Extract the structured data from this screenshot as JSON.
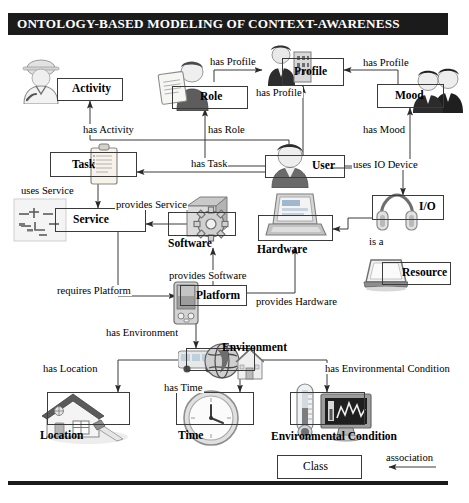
{
  "title": "ONTOLOGY-BASED MODELING OF CONTEXT-AWARENESS",
  "nodes": [
    {
      "id": "activity",
      "label": "Activity",
      "icon": "worker-person-icon"
    },
    {
      "id": "role",
      "label": "Role",
      "icon": "person-clipboard-icon"
    },
    {
      "id": "profile",
      "label": "Profile",
      "icon": "person-document-icon"
    },
    {
      "id": "mood",
      "label": "Mood",
      "icon": "two-people-icon"
    },
    {
      "id": "task",
      "label": "Task",
      "icon": "clipboard-icon"
    },
    {
      "id": "user",
      "label": "User",
      "icon": "person-icon"
    },
    {
      "id": "io",
      "label": "I/O",
      "icon": "headphones-icon"
    },
    {
      "id": "service",
      "label": "Service",
      "icon": "blueprint-icon"
    },
    {
      "id": "software",
      "label": "Software",
      "icon": "gear-box-icon"
    },
    {
      "id": "hardware",
      "label": "Hardware",
      "icon": "laptop-icon"
    },
    {
      "id": "resource",
      "label": "Resource",
      "icon": "tablet-icon"
    },
    {
      "id": "platform",
      "label": "Platform",
      "icon": "pda-icon"
    },
    {
      "id": "environment",
      "label": "Environment",
      "icon": "globe-bus-house-icon"
    },
    {
      "id": "location",
      "label": "Location",
      "icon": "house-icon"
    },
    {
      "id": "time",
      "label": "Time",
      "icon": "clock-icon"
    },
    {
      "id": "envcondition",
      "label": "Environmental Condition",
      "icon": "thermometer-monitor-icon"
    }
  ],
  "edges": [
    {
      "id": "has-activity",
      "label": "has Activity",
      "from": "user",
      "to": "activity"
    },
    {
      "id": "has-role",
      "label": "has Role",
      "from": "user",
      "to": "role"
    },
    {
      "id": "has-profile-role",
      "label": "has Profile",
      "from": "role",
      "to": "profile"
    },
    {
      "id": "has-profile-user",
      "label": "has Profile",
      "from": "user",
      "to": "profile"
    },
    {
      "id": "has-profile-mood",
      "label": "has Profile",
      "from": "mood",
      "to": "profile"
    },
    {
      "id": "has-mood",
      "label": "has Mood",
      "from": "user",
      "to": "mood"
    },
    {
      "id": "has-task",
      "label": "has Task",
      "from": "user",
      "to": "task"
    },
    {
      "id": "uses-service",
      "label": "uses Service",
      "from": "task",
      "to": "service"
    },
    {
      "id": "provides-service",
      "label": "provides Service",
      "from": "software",
      "to": "service"
    },
    {
      "id": "uses-io-device",
      "label": "uses IO Device",
      "from": "user",
      "to": "io"
    },
    {
      "id": "is-a",
      "label": "is a",
      "from": "io",
      "to": "hardware"
    },
    {
      "id": "provides-hardware",
      "label": "provides Hardware",
      "from": "platform",
      "to": "hardware"
    },
    {
      "id": "provides-software",
      "label": "provides Software",
      "from": "platform",
      "to": "software"
    },
    {
      "id": "requires-platform",
      "label": "requires Platform",
      "from": "service",
      "to": "platform"
    },
    {
      "id": "has-environment",
      "label": "has Environment",
      "from": "platform",
      "to": "environment"
    },
    {
      "id": "has-location",
      "label": "has Location",
      "from": "environment",
      "to": "location"
    },
    {
      "id": "has-time",
      "label": "has Time",
      "from": "environment",
      "to": "time"
    },
    {
      "id": "has-env-condition",
      "label": "has Environmental Condition",
      "from": "environment",
      "to": "envcondition"
    }
  ],
  "legend": {
    "class_label": "Class",
    "association_label": "association"
  },
  "colors": {
    "title_bar": "#1b1b1b",
    "title_text": "#ffffff",
    "line": "#3a3a3a",
    "background": "#ffffff"
  }
}
